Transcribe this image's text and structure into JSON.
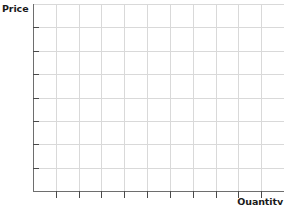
{
  "chart_data": {
    "type": "line",
    "title": "",
    "subtitle": "",
    "xlabel": "Quantity",
    "ylabel": "Price",
    "series": [],
    "categories": [],
    "values": [],
    "annotations": [],
    "legend": [],
    "legend_position": "none",
    "grid": true,
    "grid_columns": 11,
    "grid_rows": 8,
    "xlim": [
      0,
      11
    ],
    "ylim": [
      0,
      8
    ],
    "xticks": [
      0,
      1,
      2,
      3,
      4,
      5,
      6,
      7,
      8,
      9,
      10,
      11
    ],
    "yticks": [
      0,
      1,
      2,
      3,
      4,
      5,
      6,
      7,
      8
    ],
    "xtick_labels": [],
    "ytick_labels": [],
    "note": "Blank supply-and-demand style grid with no plotted data"
  },
  "labels": {
    "y_axis": "Price",
    "x_axis": "Quantity"
  },
  "colors": {
    "background": "#ffffff",
    "axis": "#6e6e6e",
    "tick": "#4a4a4a",
    "grid": "#d9d9d9",
    "grid_minor": "#ececec",
    "text": "#1a1a1a"
  },
  "geometry": {
    "plot_left": 33,
    "plot_top": 4,
    "plot_right": 284,
    "plot_bottom": 191,
    "x_step": 22.8,
    "y_step": 23.4,
    "tick_length_x": 7,
    "tick_length_y": 6
  }
}
